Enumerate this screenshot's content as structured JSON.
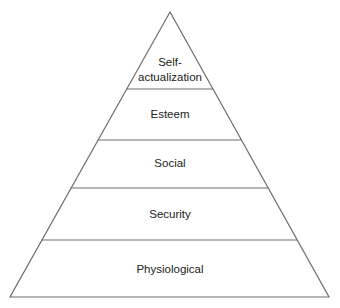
{
  "diagram": {
    "type": "pyramid",
    "colors": {
      "stroke": "#6e6e6e",
      "text": "#222222",
      "background": "#ffffff"
    },
    "levels": [
      {
        "label_line1": "Self-",
        "label_line2": "actualization"
      },
      {
        "label": "Esteem"
      },
      {
        "label": "Social"
      },
      {
        "label": "Security"
      },
      {
        "label": "Physiological"
      }
    ]
  }
}
